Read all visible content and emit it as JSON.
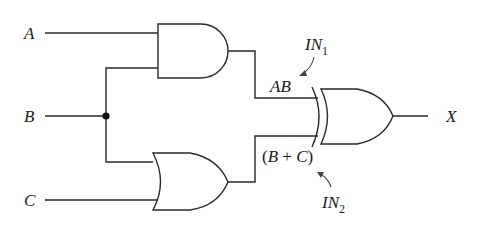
{
  "diagram": {
    "type": "logic-circuit",
    "inputs": [
      {
        "name": "A",
        "label": "A"
      },
      {
        "name": "B",
        "label": "B"
      },
      {
        "name": "C",
        "label": "C"
      }
    ],
    "gates": [
      {
        "id": "and1",
        "type": "AND",
        "inputs": [
          "A",
          "B"
        ],
        "output": "AB"
      },
      {
        "id": "or1",
        "type": "OR",
        "inputs": [
          "B",
          "C"
        ],
        "output": "(B + C)"
      },
      {
        "id": "xor1",
        "type": "XOR",
        "inputs": [
          "AB",
          "(B + C)"
        ],
        "output": "X"
      }
    ],
    "output": {
      "name": "X",
      "label": "X"
    },
    "annotations": {
      "in1": {
        "main": "IN",
        "sub": "1",
        "points_to": "AB"
      },
      "in2": {
        "main": "IN",
        "sub": "2",
        "points_to": "(B + C)"
      }
    },
    "intermediate_labels": {
      "and_out": {
        "italic": "AB"
      },
      "or_out": {
        "open": "(",
        "b": "B",
        "plus": " + ",
        "c": "C",
        "close": ")"
      }
    }
  }
}
